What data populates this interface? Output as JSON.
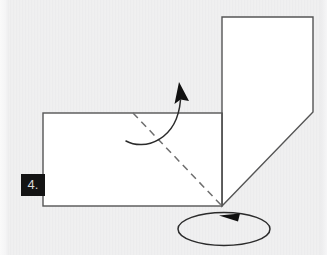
{
  "figure": {
    "step_label": "4.",
    "background_color": "#ececed",
    "paper_fill": "#ffffff",
    "stroke_color": "#555555",
    "dashed_stroke_color": "#6e6e6e",
    "arrow_color": "#1a1a1a",
    "shapes": [
      {
        "name": "upper-flap",
        "kind": "polygon",
        "points": "222,17 313,17 313,112 222,206",
        "fill": "#ffffff",
        "stroke": "#555555"
      },
      {
        "name": "base-rectangle",
        "kind": "rect",
        "x": 43,
        "y": 113,
        "width": 179,
        "height": 93,
        "fill": "#ffffff",
        "stroke": "#555555"
      }
    ],
    "fold_line": {
      "name": "diagonal-fold-crease",
      "kind": "dashed-line",
      "from": [
        133,
        113
      ],
      "to": [
        222,
        206
      ],
      "dash": "7 5"
    },
    "fold_arrow": {
      "name": "fold-direction-arrow",
      "description": "curved arrow sweeping up and to the right over the crease",
      "path": "M126,141 C143,150 176,140 180,104",
      "head_at": [
        180,
        84
      ]
    },
    "rotate_arrow": {
      "name": "rotate-indicator",
      "description": "ellipse with left pointing arrowhead indicating rotation",
      "center": [
        224,
        228
      ],
      "rx": 46,
      "ry": 17,
      "head_at": [
        222,
        216
      ]
    }
  }
}
